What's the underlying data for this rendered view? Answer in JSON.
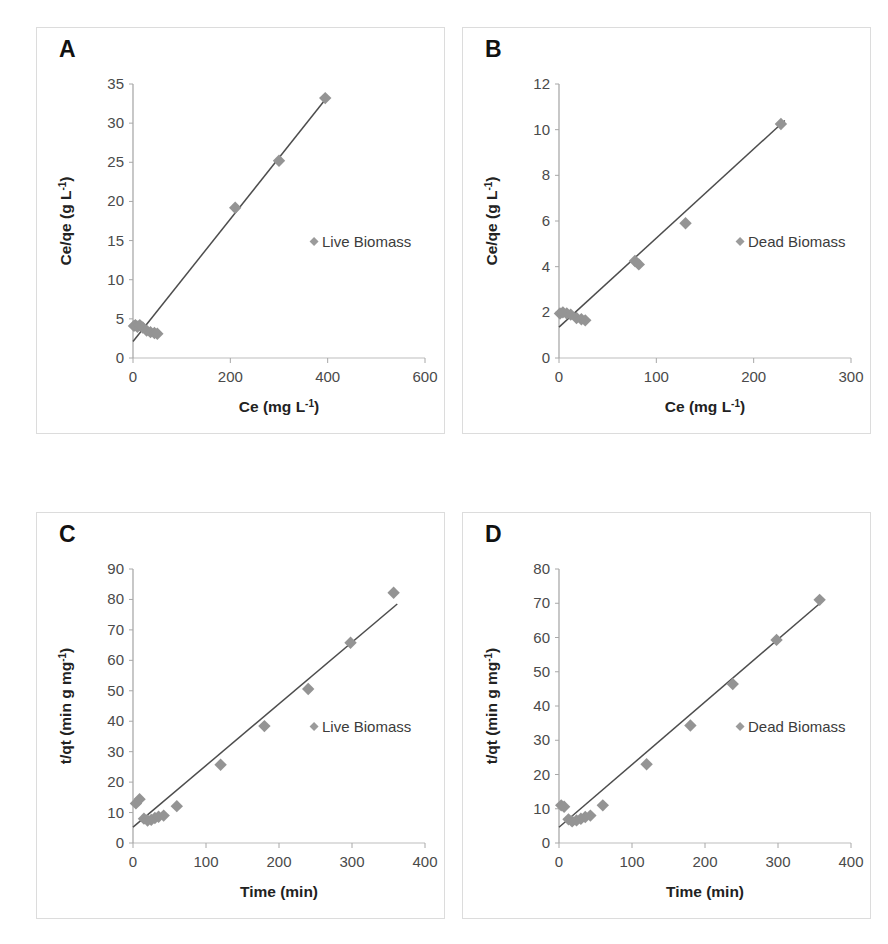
{
  "figure": {
    "background": "#ffffff",
    "marker_color": "#949494",
    "line_color": "#4d4d4d",
    "axis_color": "#9a9a9a",
    "panel_border_color": "#dcdcdc"
  },
  "panels": [
    {
      "id": "panel-a",
      "letter": "A"
    },
    {
      "id": "panel-b",
      "letter": "B"
    },
    {
      "id": "panel-c",
      "letter": "C"
    },
    {
      "id": "panel-d",
      "letter": "D"
    }
  ],
  "chart_data": [
    {
      "panel": "A",
      "type": "scatter",
      "title": "A",
      "xlabel": "Ce (mg L-1)",
      "xlabel_base": "Ce (mg L",
      "xlabel_sup": "-1",
      "xlabel_tail": ")",
      "ylabel": "Ce/qe (g L-1)",
      "ylabel_base": "Ce/qe (g L",
      "ylabel_sup": "-1",
      "ylabel_tail": ")",
      "xlim": [
        0,
        600
      ],
      "ylim": [
        0,
        35
      ],
      "xticks": [
        0,
        200,
        400,
        600
      ],
      "yticks": [
        0,
        5,
        10,
        15,
        20,
        25,
        30,
        35
      ],
      "grid": false,
      "legend": {
        "label": "Live Biomass",
        "position": "center-right"
      },
      "series": [
        {
          "name": "Live Biomass",
          "points": [
            [
              2,
              4.1
            ],
            [
              5,
              4.2
            ],
            [
              9,
              4.0
            ],
            [
              14,
              4.2
            ],
            [
              20,
              3.9
            ],
            [
              28,
              3.5
            ],
            [
              36,
              3.3
            ],
            [
              44,
              3.2
            ],
            [
              50,
              3.1
            ],
            [
              210,
              19.2
            ],
            [
              300,
              25.2
            ],
            [
              395,
              33.2
            ]
          ]
        }
      ],
      "trendline": {
        "x0": 0,
        "y0": 2.1,
        "x1": 400,
        "y1": 33.4
      }
    },
    {
      "panel": "B",
      "type": "scatter",
      "title": "B",
      "xlabel": "Ce (mg L-1)",
      "xlabel_base": "Ce (mg L",
      "xlabel_sup": "-1",
      "xlabel_tail": ")",
      "ylabel": "Ce/qe (g L-1)",
      "ylabel_base": "Ce/qe (g L",
      "ylabel_sup": "-1",
      "ylabel_tail": ")",
      "xlim": [
        0,
        300
      ],
      "ylim": [
        0,
        12
      ],
      "xticks": [
        0,
        100,
        200,
        300
      ],
      "yticks": [
        0,
        2,
        4,
        6,
        8,
        10,
        12
      ],
      "grid": false,
      "legend": {
        "label": "Dead Biomass",
        "position": "center-right"
      },
      "series": [
        {
          "name": "Dead Biomass",
          "points": [
            [
              1,
              1.95
            ],
            [
              4,
              2.0
            ],
            [
              8,
              1.95
            ],
            [
              12,
              1.9
            ],
            [
              18,
              1.75
            ],
            [
              23,
              1.7
            ],
            [
              27,
              1.65
            ],
            [
              78,
              4.25
            ],
            [
              82,
              4.1
            ],
            [
              130,
              5.9
            ],
            [
              228,
              10.25
            ]
          ]
        }
      ],
      "trendline": {
        "x0": 0,
        "y0": 1.35,
        "x1": 232,
        "y1": 10.4
      }
    },
    {
      "panel": "C",
      "type": "scatter",
      "title": "C",
      "xlabel": "Time (min)",
      "xlabel_base": "Time (min)",
      "xlabel_sup": "",
      "xlabel_tail": "",
      "ylabel": "t/qt (min g mg-1)",
      "ylabel_base": "t/qt (min g mg",
      "ylabel_sup": "-1",
      "ylabel_tail": ")",
      "xlim": [
        0,
        400
      ],
      "ylim": [
        0,
        90
      ],
      "xticks": [
        0,
        100,
        200,
        300,
        400
      ],
      "yticks": [
        0,
        10,
        20,
        30,
        40,
        50,
        60,
        70,
        80,
        90
      ],
      "grid": false,
      "legend": {
        "label": "Live Biomass",
        "position": "center-right"
      },
      "series": [
        {
          "name": "Live Biomass",
          "points": [
            [
              4,
              13.0
            ],
            [
              9,
              14.4
            ],
            [
              15,
              8.0
            ],
            [
              20,
              7.4
            ],
            [
              25,
              7.6
            ],
            [
              30,
              8.2
            ],
            [
              35,
              8.6
            ],
            [
              42,
              9.0
            ],
            [
              60,
              12.1
            ],
            [
              120,
              25.7
            ],
            [
              180,
              38.4
            ],
            [
              240,
              50.6
            ],
            [
              298,
              65.8
            ],
            [
              357,
              82.2
            ]
          ]
        }
      ],
      "trendline": {
        "x0": 0,
        "y0": 5.2,
        "x1": 362,
        "y1": 78.5
      }
    },
    {
      "panel": "D",
      "type": "scatter",
      "title": "D",
      "xlabel": "Time (min)",
      "xlabel_base": "Time (min)",
      "xlabel_sup": "",
      "xlabel_tail": "",
      "ylabel": "t/qt (min g mg-1)",
      "ylabel_base": "t/qt (min g mg",
      "ylabel_sup": "-1",
      "ylabel_tail": ")",
      "xlim": [
        0,
        400
      ],
      "ylim": [
        0,
        80
      ],
      "xticks": [
        0,
        100,
        200,
        300,
        400
      ],
      "yticks": [
        0,
        10,
        20,
        30,
        40,
        50,
        60,
        70,
        80
      ],
      "grid": false,
      "legend": {
        "label": "Dead Biomass",
        "position": "center-right"
      },
      "series": [
        {
          "name": "Dead Biomass",
          "points": [
            [
              3,
              11.0
            ],
            [
              7,
              10.6
            ],
            [
              13,
              6.9
            ],
            [
              18,
              6.3
            ],
            [
              24,
              6.6
            ],
            [
              30,
              7.1
            ],
            [
              36,
              7.6
            ],
            [
              43,
              8.0
            ],
            [
              60,
              11.0
            ],
            [
              120,
              23.0
            ],
            [
              180,
              34.3
            ],
            [
              238,
              46.4
            ],
            [
              298,
              59.3
            ],
            [
              357,
              71.0
            ]
          ]
        }
      ],
      "trendline": {
        "x0": 0,
        "y0": 4.6,
        "x1": 362,
        "y1": 70.8
      }
    }
  ]
}
